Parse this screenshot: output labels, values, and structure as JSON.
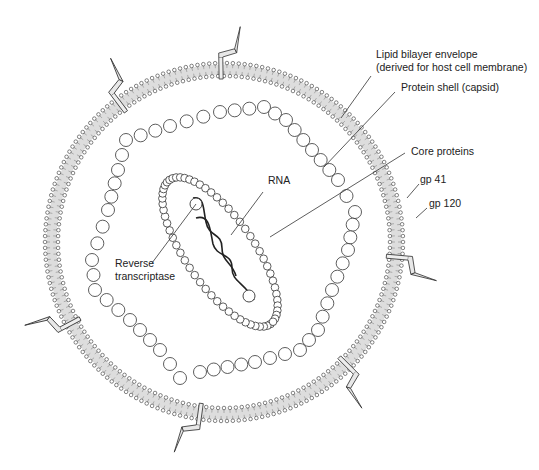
{
  "diagram": {
    "colors": {
      "stroke": "#333333",
      "background": "#ffffff",
      "spike_fill": "#e8e8e8"
    },
    "labels": {
      "lipid_envelope_line1": "Lipid bilayer envelope",
      "lipid_envelope_line2": "(derived for host cell membrane)",
      "capsid": "Protein shell (capsid)",
      "core_proteins": "Core proteins",
      "gp41": "gp 41",
      "gp120": "gp 120",
      "rna": "RNA",
      "reverse_transcriptase_line1": "Reverse",
      "reverse_transcriptase_line2": "transcriptase"
    },
    "components": [
      {
        "name": "Lipid bilayer envelope",
        "shape": "circular bilayer of small beads"
      },
      {
        "name": "Protein shell (capsid)",
        "shape": "irregular ring of large beads"
      },
      {
        "name": "Core proteins",
        "shape": "rotated oval of small beads"
      },
      {
        "name": "RNA",
        "shape": "two wavy strands"
      },
      {
        "name": "Reverse transcriptase",
        "shape": "two small circles"
      },
      {
        "name": "gp 41 / gp 120",
        "shape": "6 spikes through envelope"
      }
    ]
  }
}
